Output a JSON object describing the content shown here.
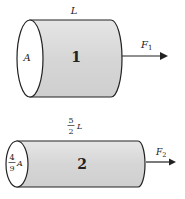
{
  "cylinders": [
    {
      "id": "1",
      "label": "1",
      "length_label": "L",
      "area_label": "A",
      "force_label": "F",
      "force_sub": "1"
    },
    {
      "id": "2",
      "label": "2",
      "length_num": "5",
      "length_den": "2",
      "length_var": "L",
      "area_num": "4",
      "area_den": "9",
      "area_var": "A",
      "force_label": "F",
      "force_sub": "2"
    }
  ],
  "colors": {
    "body_fill": "#d9d9d9",
    "outline": "#222222",
    "face_fill": "#ffffff"
  }
}
